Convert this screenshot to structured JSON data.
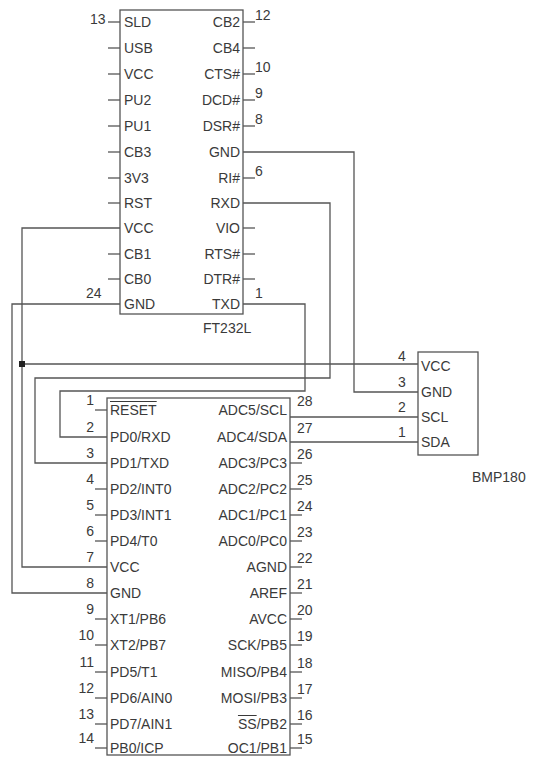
{
  "colors": {
    "line": "#555555",
    "text": "#3a3a3a",
    "background": "#ffffff"
  },
  "ft232l": {
    "name": "FT232L",
    "left_pins": [
      {
        "label": "SLD",
        "num": "13"
      },
      {
        "label": "USB",
        "num": ""
      },
      {
        "label": "VCC",
        "num": ""
      },
      {
        "label": "PU2",
        "num": ""
      },
      {
        "label": "PU1",
        "num": ""
      },
      {
        "label": "CB3",
        "num": ""
      },
      {
        "label": "3V3",
        "num": ""
      },
      {
        "label": "RST",
        "num": ""
      },
      {
        "label": "VCC",
        "num": ""
      },
      {
        "label": "CB1",
        "num": ""
      },
      {
        "label": "CB0",
        "num": ""
      },
      {
        "label": "GND",
        "num": "24"
      }
    ],
    "right_pins": [
      {
        "label": "CB2",
        "num": "12"
      },
      {
        "label": "CB4",
        "num": ""
      },
      {
        "label": "CTS#",
        "num": "10"
      },
      {
        "label": "DCD#",
        "num": "9"
      },
      {
        "label": "DSR#",
        "num": "8"
      },
      {
        "label": "GND",
        "num": ""
      },
      {
        "label": "RI#",
        "num": "6"
      },
      {
        "label": "RXD",
        "num": ""
      },
      {
        "label": "VIO",
        "num": ""
      },
      {
        "label": "RTS#",
        "num": ""
      },
      {
        "label": "DTR#",
        "num": ""
      },
      {
        "label": "TXD",
        "num": "1"
      }
    ]
  },
  "atmega": {
    "left_pins": [
      {
        "label": "RESET",
        "num": "1",
        "overline": true
      },
      {
        "label": "PD0/RXD",
        "num": "2"
      },
      {
        "label": "PD1/TXD",
        "num": "3"
      },
      {
        "label": "PD2/INT0",
        "num": "4"
      },
      {
        "label": "PD3/INT1",
        "num": "5"
      },
      {
        "label": "PD4/T0",
        "num": "6"
      },
      {
        "label": "VCC",
        "num": "7"
      },
      {
        "label": "GND",
        "num": "8"
      },
      {
        "label": "XT1/PB6",
        "num": "9"
      },
      {
        "label": "XT2/PB7",
        "num": "10"
      },
      {
        "label": "PD5/T1",
        "num": "11"
      },
      {
        "label": "PD6/AIN0",
        "num": "12"
      },
      {
        "label": "PD7/AIN1",
        "num": "13"
      },
      {
        "label": "PB0/ICP",
        "num": "14"
      }
    ],
    "right_pins": [
      {
        "label": "ADC5/SCL",
        "num": "28"
      },
      {
        "label": "ADC4/SDA",
        "num": "27"
      },
      {
        "label": "ADC3/PC3",
        "num": "26"
      },
      {
        "label": "ADC2/PC2",
        "num": "25"
      },
      {
        "label": "ADC1/PC1",
        "num": "24"
      },
      {
        "label": "ADC0/PC0",
        "num": "23"
      },
      {
        "label": "AGND",
        "num": "22"
      },
      {
        "label": "AREF",
        "num": "21"
      },
      {
        "label": "AVCC",
        "num": "20"
      },
      {
        "label": "SCK/PB5",
        "num": "19"
      },
      {
        "label": "MISO/PB4",
        "num": "18"
      },
      {
        "label": "MOSI/PB3",
        "num": "17"
      },
      {
        "label": "/PB2",
        "num": "16",
        "prefix_overline": "SS"
      },
      {
        "label": "OC1/PB1",
        "num": "15"
      }
    ]
  },
  "bmp180": {
    "name": "BMP180",
    "pins": [
      {
        "label": "VCC",
        "num": "4"
      },
      {
        "label": "GND",
        "num": "3"
      },
      {
        "label": "SCL",
        "num": "2"
      },
      {
        "label": "SDA",
        "num": "1"
      }
    ]
  }
}
